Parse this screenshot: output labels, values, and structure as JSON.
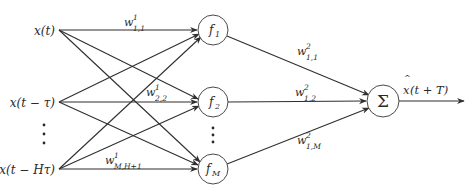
{
  "diagram": {
    "type": "neural-network",
    "colors": {
      "line": "#2f2f2f",
      "node_stroke": "#4a4a4a",
      "text": "#2a2a2a",
      "background": "#ffffff"
    },
    "inputs": [
      {
        "id": "in1",
        "label": "x(t)"
      },
      {
        "id": "in2",
        "label": "x(t − τ)"
      },
      {
        "id": "in3",
        "label": "x(t − Hτ)"
      }
    ],
    "input_ellipsis": "⋮",
    "hidden": [
      {
        "id": "f1",
        "base": "f",
        "sub": "1"
      },
      {
        "id": "f2",
        "base": "f",
        "sub": "2"
      },
      {
        "id": "fM",
        "base": "f",
        "sub": "M"
      }
    ],
    "hidden_ellipsis": "⋮",
    "output_node": {
      "id": "sum",
      "label": "Σ"
    },
    "output": {
      "base": "x",
      "hat": "^",
      "rest": "(t + T)"
    },
    "layer1_weights": [
      {
        "base": "w",
        "sup": "1",
        "sub": "1,1"
      },
      {
        "base": "w",
        "sup": "1",
        "sub": "2,2"
      },
      {
        "base": "w",
        "sup": "1",
        "sub": "M,H+1"
      }
    ],
    "layer2_weights": [
      {
        "base": "w",
        "sup": "2",
        "sub": "1,1"
      },
      {
        "base": "w",
        "sup": "2",
        "sub": "1,2"
      },
      {
        "base": "w",
        "sup": "2",
        "sub": "1,M"
      }
    ]
  }
}
